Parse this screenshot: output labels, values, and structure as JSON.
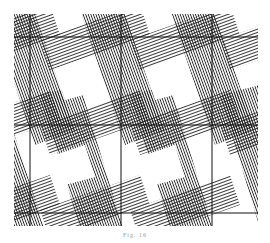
{
  "figure": {
    "caption": "Fig. 16",
    "grid": {
      "vertical_lines_x": [
        30,
        121,
        212
      ],
      "horizontal_lines_y": [
        37,
        125,
        213
      ]
    },
    "colors": {
      "ink": "#222222",
      "background": "#ffffff"
    }
  }
}
